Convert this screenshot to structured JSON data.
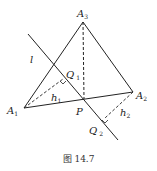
{
  "figure": {
    "caption": "图 14.7",
    "points": {
      "A1": {
        "label": "A",
        "sub": "1"
      },
      "A2": {
        "label": "A",
        "sub": "2"
      },
      "A3": {
        "label": "A",
        "sub": "3"
      },
      "P": {
        "label": "P"
      },
      "Q1": {
        "label": "Q",
        "sub": "1"
      },
      "Q2": {
        "label": "Q",
        "sub": "2"
      }
    },
    "line_label": "l",
    "distances": {
      "h1": {
        "label": "h",
        "sub": "1"
      },
      "h2": {
        "label": "h",
        "sub": "2"
      }
    }
  }
}
